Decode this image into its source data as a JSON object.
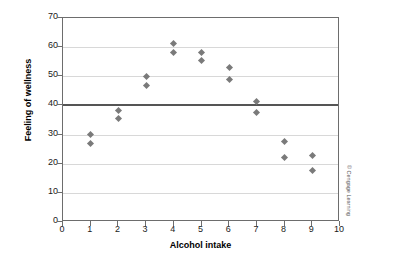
{
  "chart_data": {
    "type": "scatter",
    "title": "",
    "xlabel": "Alcohol intake",
    "ylabel": "Feeling of wellness",
    "xlim": [
      0,
      10
    ],
    "ylim": [
      0,
      70
    ],
    "xticks": [
      "0",
      "1",
      "2",
      "3",
      "4",
      "5",
      "6",
      "7",
      "8",
      "9",
      "10"
    ],
    "yticks": [
      "0",
      "10",
      "20",
      "30",
      "40",
      "50",
      "60",
      "70"
    ],
    "grid": true,
    "legend": "none",
    "reference_line": {
      "y": 40,
      "color": "#555555"
    },
    "marker": {
      "shape": "diamond",
      "color": "#7a7a7a",
      "size": 5
    },
    "x": [
      1,
      1,
      2,
      2,
      3,
      3,
      4,
      4,
      5,
      5,
      6,
      6,
      7,
      7,
      8,
      8,
      9,
      9
    ],
    "y": [
      30.0,
      26.8,
      38.4,
      35.6,
      49.8,
      46.8,
      61.3,
      58.2,
      58.2,
      55.3,
      53.0,
      49.0,
      41.4,
      37.5,
      27.5,
      22.0,
      22.7,
      17.8
    ],
    "points": [
      {
        "x": 1,
        "y": 30.0
      },
      {
        "x": 1,
        "y": 26.8
      },
      {
        "x": 2,
        "y": 38.4
      },
      {
        "x": 2,
        "y": 35.6
      },
      {
        "x": 3,
        "y": 49.8
      },
      {
        "x": 3,
        "y": 46.8
      },
      {
        "x": 4,
        "y": 61.3
      },
      {
        "x": 4,
        "y": 58.2
      },
      {
        "x": 5,
        "y": 58.2
      },
      {
        "x": 5,
        "y": 55.3
      },
      {
        "x": 6,
        "y": 53.0
      },
      {
        "x": 6,
        "y": 49.0
      },
      {
        "x": 7,
        "y": 41.4
      },
      {
        "x": 7,
        "y": 37.5
      },
      {
        "x": 8,
        "y": 27.5
      },
      {
        "x": 8,
        "y": 22.0
      },
      {
        "x": 9,
        "y": 22.7
      },
      {
        "x": 9,
        "y": 17.8
      }
    ]
  },
  "credit": {
    "text": "© Cengage Learning"
  }
}
